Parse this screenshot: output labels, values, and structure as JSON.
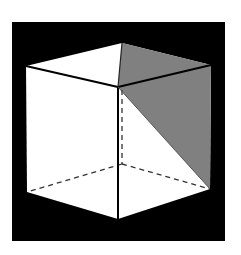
{
  "figure": {
    "background_color": "#ffffff",
    "frame_color": "#000000",
    "face_color": "#ffffff",
    "shade_color": "#808080",
    "edge_color": "#000000",
    "hidden_edge_style": "dashed"
  },
  "vertices": {
    "top_back": [
      122,
      43
    ],
    "top_left": [
      26,
      66
    ],
    "top_right": [
      211,
      65
    ],
    "top_front": [
      118,
      87
    ],
    "bottom_back": [
      122,
      164
    ],
    "bottom_left": [
      27,
      192
    ],
    "bottom_right": [
      210,
      189
    ],
    "bottom_front": [
      118,
      219
    ]
  }
}
